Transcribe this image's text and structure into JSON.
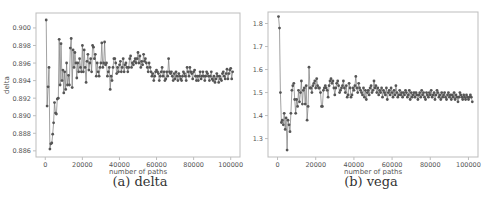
{
  "chart_data": [
    {
      "type": "line",
      "caption": "(a) delta",
      "title": "",
      "xlabel": "number of paths",
      "ylabel": "delta",
      "xlim": [
        -5000,
        105000
      ],
      "ylim": [
        0.8853,
        0.9017
      ],
      "xticks": [
        0,
        20000,
        40000,
        60000,
        80000,
        100000
      ],
      "xtick_labels": [
        "0",
        "20000",
        "40000",
        "60000",
        "80000",
        "100000"
      ],
      "yticks": [
        0.886,
        0.888,
        0.89,
        0.892,
        0.894,
        0.896,
        0.898,
        0.9
      ],
      "ytick_labels": [
        "0.886",
        "0.888",
        "0.890",
        "0.892",
        "0.894",
        "0.896",
        "0.898",
        "0.900"
      ],
      "grid": false,
      "legend": null,
      "marker": "o",
      "x_start": 500,
      "x_step": 500,
      "values": [
        0.9009,
        0.8911,
        0.8933,
        0.8955,
        0.8862,
        0.8868,
        0.8869,
        0.8879,
        0.8892,
        0.8915,
        0.8903,
        0.8902,
        0.8919,
        0.892,
        0.8987,
        0.8935,
        0.8982,
        0.894,
        0.8952,
        0.8926,
        0.895,
        0.893,
        0.896,
        0.8935,
        0.8946,
        0.8935,
        0.8977,
        0.8988,
        0.8932,
        0.8975,
        0.8955,
        0.8972,
        0.896,
        0.8943,
        0.896,
        0.895,
        0.8965,
        0.8955,
        0.895,
        0.898,
        0.895,
        0.8975,
        0.8955,
        0.8938,
        0.8962,
        0.897,
        0.8952,
        0.896,
        0.8965,
        0.895,
        0.898,
        0.8978,
        0.8965,
        0.897,
        0.8945,
        0.896,
        0.895,
        0.8945,
        0.8955,
        0.896,
        0.8983,
        0.8955,
        0.896,
        0.8984,
        0.8958,
        0.896,
        0.8945,
        0.895,
        0.8955,
        0.893,
        0.8945,
        0.894,
        0.8955,
        0.8965,
        0.8965,
        0.896,
        0.8948,
        0.8955,
        0.895,
        0.8958,
        0.8962,
        0.895,
        0.8955,
        0.8965,
        0.895,
        0.8958,
        0.896,
        0.8955,
        0.895,
        0.8955,
        0.8965,
        0.8968,
        0.8955,
        0.896,
        0.8958,
        0.8962,
        0.8965,
        0.896,
        0.8965,
        0.8972,
        0.896,
        0.8968,
        0.8955,
        0.8962,
        0.8958,
        0.897,
        0.8962,
        0.8965,
        0.896,
        0.8955,
        0.895,
        0.896,
        0.8955,
        0.895,
        0.8945,
        0.8948,
        0.894,
        0.8945,
        0.895,
        0.8952,
        0.895,
        0.8948,
        0.894,
        0.8945,
        0.895,
        0.8955,
        0.8945,
        0.895,
        0.894,
        0.8942,
        0.895,
        0.8945,
        0.8965,
        0.895,
        0.8948,
        0.895,
        0.8945,
        0.894,
        0.8948,
        0.8942,
        0.895,
        0.8945,
        0.894,
        0.8948,
        0.8945,
        0.8942,
        0.894,
        0.8945,
        0.895,
        0.8948,
        0.8945,
        0.894,
        0.8955,
        0.895,
        0.8945,
        0.8955,
        0.895,
        0.8948,
        0.8942,
        0.895,
        0.8952,
        0.8945,
        0.894,
        0.8945,
        0.894,
        0.8945,
        0.895,
        0.8942,
        0.8945,
        0.895,
        0.8945,
        0.894,
        0.8945,
        0.895,
        0.8948,
        0.8945,
        0.894,
        0.8945,
        0.895,
        0.8942,
        0.894,
        0.8945,
        0.8938,
        0.8942,
        0.8948,
        0.8945,
        0.8938,
        0.8945,
        0.8942,
        0.894,
        0.8948,
        0.895,
        0.8945,
        0.8942,
        0.8948,
        0.8953,
        0.8942,
        0.8948,
        0.8952,
        0.8954,
        0.8942,
        0.895
      ]
    },
    {
      "type": "line",
      "caption": "(b) vega",
      "title": "",
      "xlabel": "number of paths",
      "ylabel": "vega",
      "xlim": [
        -5000,
        105000
      ],
      "ylim": [
        1.22,
        1.85
      ],
      "xticks": [
        0,
        20000,
        40000,
        60000,
        80000,
        100000
      ],
      "xtick_labels": [
        "0",
        "20000",
        "40000",
        "60000",
        "80000",
        "100000"
      ],
      "yticks": [
        1.3,
        1.4,
        1.5,
        1.6,
        1.7,
        1.8
      ],
      "ytick_labels": [
        "1.3",
        "1.4",
        "1.5",
        "1.6",
        "1.7",
        "1.8"
      ],
      "grid": false,
      "legend": null,
      "marker": "o",
      "x_start": 500,
      "x_step": 500,
      "values": [
        1.83,
        1.78,
        1.5,
        1.37,
        1.38,
        1.36,
        1.41,
        1.34,
        1.39,
        1.25,
        1.38,
        1.36,
        1.33,
        1.41,
        1.51,
        1.53,
        1.54,
        1.47,
        1.41,
        1.47,
        1.44,
        1.51,
        1.46,
        1.5,
        1.55,
        1.45,
        1.51,
        1.52,
        1.45,
        1.53,
        1.38,
        1.44,
        1.61,
        1.52,
        1.52,
        1.5,
        1.53,
        1.54,
        1.55,
        1.52,
        1.56,
        1.53,
        1.52,
        1.52,
        1.5,
        1.44,
        1.44,
        1.51,
        1.52,
        1.53,
        1.52,
        1.51,
        1.48,
        1.53,
        1.55,
        1.56,
        1.54,
        1.55,
        1.52,
        1.49,
        1.52,
        1.54,
        1.55,
        1.53,
        1.5,
        1.51,
        1.52,
        1.53,
        1.55,
        1.52,
        1.5,
        1.53,
        1.48,
        1.49,
        1.54,
        1.52,
        1.48,
        1.49,
        1.52,
        1.51,
        1.53,
        1.57,
        1.52,
        1.5,
        1.54,
        1.52,
        1.51,
        1.5,
        1.49,
        1.52,
        1.48,
        1.51,
        1.47,
        1.5,
        1.51,
        1.49,
        1.52,
        1.53,
        1.5,
        1.51,
        1.55,
        1.52,
        1.53,
        1.5,
        1.52,
        1.49,
        1.51,
        1.5,
        1.52,
        1.48,
        1.51,
        1.5,
        1.49,
        1.52,
        1.47,
        1.5,
        1.51,
        1.49,
        1.52,
        1.5,
        1.48,
        1.51,
        1.49,
        1.53,
        1.5,
        1.48,
        1.49,
        1.51,
        1.49,
        1.5,
        1.48,
        1.5,
        1.49,
        1.51,
        1.5,
        1.48,
        1.49,
        1.51,
        1.47,
        1.5,
        1.48,
        1.49,
        1.5,
        1.48,
        1.5,
        1.49,
        1.47,
        1.49,
        1.5,
        1.48,
        1.51,
        1.49,
        1.5,
        1.48,
        1.47,
        1.5,
        1.49,
        1.48,
        1.5,
        1.49,
        1.51,
        1.48,
        1.49,
        1.5,
        1.47,
        1.49,
        1.51,
        1.5,
        1.48,
        1.49,
        1.47,
        1.5,
        1.48,
        1.49,
        1.5,
        1.48,
        1.47,
        1.49,
        1.5,
        1.48,
        1.49,
        1.47,
        1.49,
        1.48,
        1.5,
        1.47,
        1.49,
        1.48,
        1.46,
        1.48,
        1.5,
        1.49,
        1.48,
        1.47,
        1.49,
        1.48,
        1.47,
        1.49,
        1.48,
        1.47,
        1.48,
        1.49,
        1.48,
        1.46
      ]
    }
  ],
  "captions": {
    "a": "(a) delta",
    "b": "(b) vega"
  },
  "colors": {
    "line": "#7a7a7a",
    "marker": "#555555",
    "frame": "#bdbdbd",
    "tick_text": "#555555",
    "background": "#ffffff"
  }
}
